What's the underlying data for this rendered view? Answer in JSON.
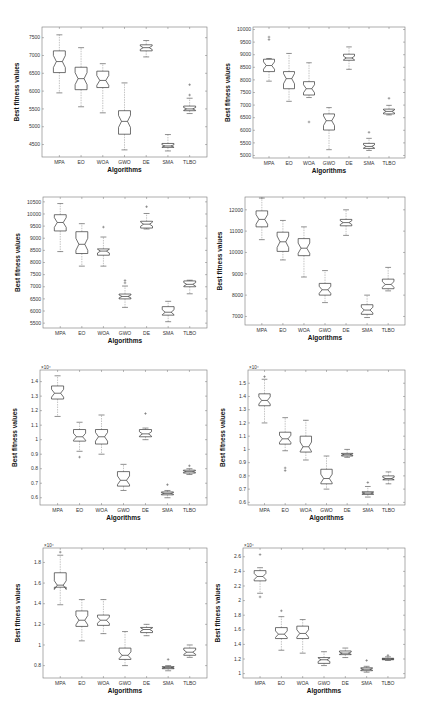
{
  "figure": {
    "layout": "4 rows x 2 columns grid of notched box plots",
    "common_xlabel": "Algorithms",
    "common_ylabel": "Best fitness values"
  },
  "chart_data": [
    {
      "type": "boxplot",
      "panel": "row1-left",
      "title": "",
      "xlabel": "Algorithms",
      "ylabel": "Best fitness values",
      "categories": [
        "MPA",
        "EO",
        "WOA",
        "GWO",
        "DE",
        "SMA",
        "TLBO"
      ],
      "y_ticks": [
        4500,
        5000,
        5500,
        6000,
        6500,
        7000,
        7500
      ],
      "y_tick_labels": [
        "4500",
        "5000",
        "5500",
        "6000",
        "6500",
        "7000",
        "7500"
      ],
      "exponent_label": "",
      "ylim": [
        4150,
        7800
      ],
      "rect": {
        "x0": 42,
        "x1": 207,
        "y0": 27,
        "y1": 157
      },
      "boxes": [
        {
          "whisker_low": 5950,
          "q1": 6520,
          "median": 6830,
          "q3": 7130,
          "whisker_high": 7580,
          "outliers": []
        },
        {
          "whisker_low": 5560,
          "q1": 6040,
          "median": 6350,
          "q3": 6670,
          "whisker_high": 7220,
          "outliers": []
        },
        {
          "whisker_low": 5390,
          "q1": 6100,
          "median": 6300,
          "q3": 6560,
          "whisker_high": 6770,
          "outliers": []
        },
        {
          "whisker_low": 4350,
          "q1": 4790,
          "median": 5150,
          "q3": 5450,
          "whisker_high": 6230,
          "outliers": []
        },
        {
          "whisker_low": 6960,
          "q1": 7130,
          "median": 7220,
          "q3": 7300,
          "whisker_high": 7420,
          "outliers": []
        },
        {
          "whisker_low": 4320,
          "q1": 4420,
          "median": 4460,
          "q3": 4530,
          "whisker_high": 4780,
          "outliers": []
        },
        {
          "whisker_low": 5370,
          "q1": 5450,
          "median": 5500,
          "q3": 5580,
          "whisker_high": 5800,
          "outliers": [
            5890,
            6180
          ]
        }
      ]
    },
    {
      "type": "boxplot",
      "panel": "row1-right",
      "title": "",
      "xlabel": "Algorithms",
      "ylabel": "Best fitness values",
      "categories": [
        "MPA",
        "EO",
        "WOA",
        "GWO",
        "DE",
        "SMA",
        "TLBO"
      ],
      "y_ticks": [
        5000,
        5500,
        6000,
        6500,
        7000,
        7500,
        8000,
        8500,
        9000,
        9500,
        10000
      ],
      "y_tick_labels": [
        "5000",
        "5500",
        "6000",
        "6500",
        "7000",
        "7500",
        "8000",
        "8500",
        "9000",
        "9500",
        "10000"
      ],
      "exponent_label": "",
      "ylim": [
        4900,
        10100
      ],
      "rect": {
        "x0": 253,
        "x1": 405,
        "y0": 27,
        "y1": 158
      },
      "boxes": [
        {
          "whisker_low": 7950,
          "q1": 8330,
          "median": 8570,
          "q3": 8820,
          "whisker_high": 8850,
          "outliers": [
            9700,
            9600
          ]
        },
        {
          "whisker_low": 7150,
          "q1": 7650,
          "median": 8050,
          "q3": 8330,
          "whisker_high": 9050,
          "outliers": []
        },
        {
          "whisker_low": 7300,
          "q1": 7400,
          "median": 7650,
          "q3": 7930,
          "whisker_high": 8680,
          "outliers": [
            6330
          ]
        },
        {
          "whisker_low": 5230,
          "q1": 6010,
          "median": 6380,
          "q3": 6650,
          "whisker_high": 6900,
          "outliers": []
        },
        {
          "whisker_low": 8420,
          "q1": 8780,
          "median": 8870,
          "q3": 9020,
          "whisker_high": 9310,
          "outliers": []
        },
        {
          "whisker_low": 5200,
          "q1": 5280,
          "median": 5360,
          "q3": 5480,
          "whisker_high": 5680,
          "outliers": [
            5920
          ]
        },
        {
          "whisker_low": 6610,
          "q1": 6650,
          "median": 6750,
          "q3": 6840,
          "whisker_high": 6990,
          "outliers": [
            7270
          ]
        }
      ]
    },
    {
      "type": "boxplot",
      "panel": "row2-left",
      "title": "",
      "xlabel": "Algorithms",
      "ylabel": "Best fitness values",
      "categories": [
        "MPA",
        "EO",
        "WOA",
        "GWO",
        "DE",
        "SMA",
        "TLBO"
      ],
      "y_ticks": [
        5500,
        6000,
        6500,
        7000,
        7500,
        8000,
        8500,
        9000,
        9500,
        10000,
        10500
      ],
      "y_tick_labels": [
        "5500",
        "6000",
        "6500",
        "7000",
        "7500",
        "8000",
        "8500",
        "9000",
        "9500",
        "10000",
        "10500"
      ],
      "exponent_label": "",
      "ylim": [
        5300,
        10700
      ],
      "rect": {
        "x0": 43,
        "x1": 207,
        "y0": 197,
        "y1": 328
      },
      "boxes": [
        {
          "whisker_low": 8450,
          "q1": 9300,
          "median": 9650,
          "q3": 9970,
          "whisker_high": 10430,
          "outliers": []
        },
        {
          "whisker_low": 7850,
          "q1": 8370,
          "median": 8750,
          "q3": 9270,
          "whisker_high": 9600,
          "outliers": []
        },
        {
          "whisker_low": 7850,
          "q1": 8300,
          "median": 8470,
          "q3": 8560,
          "whisker_high": 9050,
          "outliers": [
            9460
          ]
        },
        {
          "whisker_low": 6150,
          "q1": 6500,
          "median": 6600,
          "q3": 6700,
          "whisker_high": 7030,
          "outliers": [
            7160,
            7260
          ]
        },
        {
          "whisker_low": 9380,
          "q1": 9420,
          "median": 9580,
          "q3": 9700,
          "whisker_high": 10020,
          "outliers": [
            10300
          ]
        },
        {
          "whisker_low": 5560,
          "q1": 5830,
          "median": 5950,
          "q3": 6180,
          "whisker_high": 6400,
          "outliers": []
        },
        {
          "whisker_low": 6710,
          "q1": 7000,
          "median": 7100,
          "q3": 7240,
          "whisker_high": 7270,
          "outliers": []
        }
      ]
    },
    {
      "type": "boxplot",
      "panel": "row2-right",
      "title": "",
      "xlabel": "Algorithms",
      "ylabel": "Best fitness values",
      "categories": [
        "MPA",
        "EO",
        "WOA",
        "GWO",
        "DE",
        "SMA",
        "TLBO"
      ],
      "y_ticks": [
        7000,
        8000,
        9000,
        10000,
        11000,
        12000
      ],
      "y_tick_labels": [
        "7000",
        "8000",
        "9000",
        "10000",
        "11000",
        "12000"
      ],
      "exponent_label": "",
      "ylim": [
        6600,
        12600
      ],
      "rect": {
        "x0": 245,
        "x1": 405,
        "y0": 197,
        "y1": 325
      },
      "boxes": [
        {
          "whisker_low": 10600,
          "q1": 11200,
          "median": 11550,
          "q3": 11950,
          "whisker_high": 12550,
          "outliers": []
        },
        {
          "whisker_low": 9650,
          "q1": 10050,
          "median": 10500,
          "q3": 10950,
          "whisker_high": 11500,
          "outliers": []
        },
        {
          "whisker_low": 8850,
          "q1": 9850,
          "median": 10200,
          "q3": 10650,
          "whisker_high": 11200,
          "outliers": []
        },
        {
          "whisker_low": 7650,
          "q1": 8000,
          "median": 8250,
          "q3": 8550,
          "whisker_high": 9150,
          "outliers": []
        },
        {
          "whisker_low": 10800,
          "q1": 11250,
          "median": 11400,
          "q3": 11550,
          "whisker_high": 12000,
          "outliers": []
        },
        {
          "whisker_low": 6950,
          "q1": 7100,
          "median": 7300,
          "q3": 7550,
          "whisker_high": 8000,
          "outliers": []
        },
        {
          "whisker_low": 8200,
          "q1": 8300,
          "median": 8500,
          "q3": 8750,
          "whisker_high": 9300,
          "outliers": []
        }
      ]
    },
    {
      "type": "boxplot",
      "panel": "row3-left",
      "title": "",
      "xlabel": "Algorithms",
      "ylabel": "Best fitness values",
      "categories": [
        "MPA",
        "EO",
        "WOA",
        "GWO",
        "DE",
        "SMA",
        "TLBO"
      ],
      "y_ticks": [
        0.6,
        0.7,
        0.8,
        0.9,
        1.0,
        1.1,
        1.2,
        1.3,
        1.4
      ],
      "y_tick_labels": [
        "0.6",
        "0.7",
        "0.8",
        "0.9",
        "1",
        "1.1",
        "1.2",
        "1.3",
        "1.4"
      ],
      "exponent_label": "×10⁴",
      "ylim": [
        0.55,
        1.48
      ],
      "rect": {
        "x0": 40,
        "x1": 207,
        "y0": 370,
        "y1": 505
      },
      "boxes": [
        {
          "whisker_low": 1.16,
          "q1": 1.28,
          "median": 1.32,
          "q3": 1.37,
          "whisker_high": 1.44,
          "outliers": []
        },
        {
          "whisker_low": 0.92,
          "q1": 0.99,
          "median": 1.02,
          "q3": 1.07,
          "whisker_high": 1.12,
          "outliers": [
            0.88
          ]
        },
        {
          "whisker_low": 0.9,
          "q1": 0.97,
          "median": 1.02,
          "q3": 1.07,
          "whisker_high": 1.17,
          "outliers": []
        },
        {
          "whisker_low": 0.65,
          "q1": 0.68,
          "median": 0.72,
          "q3": 0.78,
          "whisker_high": 0.83,
          "outliers": []
        },
        {
          "whisker_low": 1.0,
          "q1": 1.02,
          "median": 1.04,
          "q3": 1.07,
          "whisker_high": 1.08,
          "outliers": [
            1.18
          ]
        },
        {
          "whisker_low": 0.6,
          "q1": 0.62,
          "median": 0.63,
          "q3": 0.64,
          "whisker_high": 0.65,
          "outliers": [
            0.69
          ]
        },
        {
          "whisker_low": 0.76,
          "q1": 0.77,
          "median": 0.78,
          "q3": 0.79,
          "whisker_high": 0.8,
          "outliers": [
            0.82
          ]
        }
      ]
    },
    {
      "type": "boxplot",
      "panel": "row3-right",
      "title": "",
      "xlabel": "Algorithms",
      "ylabel": "Best fitness values",
      "categories": [
        "MPA",
        "EO",
        "WOA",
        "GWO",
        "DE",
        "SMA",
        "TLBO"
      ],
      "y_ticks": [
        0.6,
        0.7,
        0.8,
        0.9,
        1.0,
        1.1,
        1.2,
        1.3,
        1.4,
        1.5
      ],
      "y_tick_labels": [
        "0.6",
        "0.7",
        "0.8",
        "0.9",
        "1",
        "1.1",
        "1.2",
        "1.3",
        "1.4",
        "1.5"
      ],
      "exponent_label": "×10⁴",
      "ylim": [
        0.58,
        1.6
      ],
      "rect": {
        "x0": 248,
        "x1": 405,
        "y0": 370,
        "y1": 505
      },
      "boxes": [
        {
          "whisker_low": 1.2,
          "q1": 1.33,
          "median": 1.37,
          "q3": 1.42,
          "whisker_high": 1.53,
          "outliers": [
            1.55
          ]
        },
        {
          "whisker_low": 0.99,
          "q1": 1.04,
          "median": 1.08,
          "q3": 1.13,
          "whisker_high": 1.24,
          "outliers": [
            0.86,
            0.84
          ]
        },
        {
          "whisker_low": 0.92,
          "q1": 0.98,
          "median": 1.02,
          "q3": 1.1,
          "whisker_high": 1.22,
          "outliers": []
        },
        {
          "whisker_low": 0.7,
          "q1": 0.74,
          "median": 0.78,
          "q3": 0.85,
          "whisker_high": 0.95,
          "outliers": []
        },
        {
          "whisker_low": 0.94,
          "q1": 0.95,
          "median": 0.96,
          "q3": 0.97,
          "whisker_high": 1.0,
          "outliers": []
        },
        {
          "whisker_low": 0.64,
          "q1": 0.66,
          "median": 0.67,
          "q3": 0.68,
          "whisker_high": 0.72,
          "outliers": [
            0.75
          ]
        },
        {
          "whisker_low": 0.74,
          "q1": 0.77,
          "median": 0.78,
          "q3": 0.8,
          "whisker_high": 0.83,
          "outliers": []
        }
      ]
    },
    {
      "type": "boxplot",
      "panel": "row4-left",
      "title": "",
      "xlabel": "Algorithms",
      "ylabel": "Best fitness values",
      "categories": [
        "MPA",
        "EO",
        "WOA",
        "GWO",
        "DE",
        "SMA",
        "TLBO"
      ],
      "y_ticks": [
        0.8,
        1.0,
        1.2,
        1.4,
        1.6,
        1.8
      ],
      "y_tick_labels": [
        "0.8",
        "1",
        "1.2",
        "1.4",
        "1.6",
        "1.8"
      ],
      "exponent_label": "×10⁴",
      "ylim": [
        0.68,
        1.94
      ],
      "rect": {
        "x0": 43,
        "x1": 207,
        "y0": 548,
        "y1": 678
      },
      "boxes": [
        {
          "whisker_low": 1.39,
          "q1": 1.56,
          "median": 1.58,
          "q3": 1.7,
          "whisker_high": 1.87,
          "outliers": [
            1.9
          ]
        },
        {
          "whisker_low": 1.04,
          "q1": 1.18,
          "median": 1.24,
          "q3": 1.33,
          "whisker_high": 1.44,
          "outliers": []
        },
        {
          "whisker_low": 1.11,
          "q1": 1.19,
          "median": 1.24,
          "q3": 1.29,
          "whisker_high": 1.44,
          "outliers": []
        },
        {
          "whisker_low": 0.8,
          "q1": 0.86,
          "median": 0.9,
          "q3": 0.97,
          "whisker_high": 1.13,
          "outliers": []
        },
        {
          "whisker_low": 1.09,
          "q1": 1.12,
          "median": 1.15,
          "q3": 1.17,
          "whisker_high": 1.2,
          "outliers": []
        },
        {
          "whisker_low": 0.75,
          "q1": 0.77,
          "median": 0.78,
          "q3": 0.79,
          "whisker_high": 0.8,
          "outliers": [
            0.86
          ]
        },
        {
          "whisker_low": 0.88,
          "q1": 0.9,
          "median": 0.93,
          "q3": 0.97,
          "whisker_high": 1.0,
          "outliers": []
        }
      ]
    },
    {
      "type": "boxplot",
      "panel": "row4-right",
      "title": "",
      "xlabel": "Algorithms",
      "ylabel": "Best fitness values",
      "categories": [
        "MPA",
        "EO",
        "WOA",
        "GWO",
        "DE",
        "SMA",
        "TLBO"
      ],
      "y_ticks": [
        1.0,
        1.2,
        1.4,
        1.6,
        1.8,
        2.0,
        2.2,
        2.4,
        2.6
      ],
      "y_tick_labels": [
        "1",
        "1.2",
        "1.4",
        "1.6",
        "1.8",
        "2",
        "2.2",
        "2.4",
        "2.6"
      ],
      "exponent_label": "×10⁴",
      "ylim": [
        0.94,
        2.72
      ],
      "rect": {
        "x0": 243,
        "x1": 405,
        "y0": 548,
        "y1": 678
      },
      "boxes": [
        {
          "whisker_low": 2.1,
          "q1": 2.27,
          "median": 2.33,
          "q3": 2.41,
          "whisker_high": 2.45,
          "outliers": [
            2.63,
            2.05
          ]
        },
        {
          "whisker_low": 1.32,
          "q1": 1.48,
          "median": 1.54,
          "q3": 1.63,
          "whisker_high": 1.78,
          "outliers": [
            1.86
          ]
        },
        {
          "whisker_low": 1.28,
          "q1": 1.48,
          "median": 1.55,
          "q3": 1.65,
          "whisker_high": 1.74,
          "outliers": []
        },
        {
          "whisker_low": 1.11,
          "q1": 1.14,
          "median": 1.19,
          "q3": 1.22,
          "whisker_high": 1.3,
          "outliers": []
        },
        {
          "whisker_low": 1.22,
          "q1": 1.26,
          "median": 1.28,
          "q3": 1.31,
          "whisker_high": 1.35,
          "outliers": []
        },
        {
          "whisker_low": 1.02,
          "q1": 1.04,
          "median": 1.06,
          "q3": 1.08,
          "whisker_high": 1.1,
          "outliers": [
            1.18
          ]
        },
        {
          "whisker_low": 1.18,
          "q1": 1.19,
          "median": 1.2,
          "q3": 1.21,
          "whisker_high": 1.23,
          "outliers": [
            1.25
          ]
        }
      ]
    }
  ]
}
